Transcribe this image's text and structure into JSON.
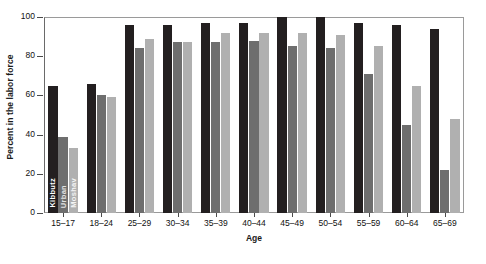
{
  "chart_data": {
    "type": "bar",
    "title": "",
    "xlabel": "Age",
    "ylabel": "Percent in the labor force",
    "categories": [
      "15–17",
      "18–24",
      "25–29",
      "30–34",
      "35–39",
      "40–44",
      "45–49",
      "50–54",
      "55–59",
      "60–64",
      "65–69"
    ],
    "series": [
      {
        "name": "Kibbutz",
        "color": "#231f20",
        "values": [
          65,
          66,
          96,
          96,
          97,
          97,
          100,
          100,
          97,
          96,
          94
        ]
      },
      {
        "name": "Urban",
        "color": "#6e6e6e",
        "values": [
          39,
          60,
          84,
          87,
          87,
          88,
          85,
          84,
          71,
          45,
          22
        ]
      },
      {
        "name": "Moshav",
        "color": "#b0b0b0",
        "values": [
          33,
          59,
          89,
          87,
          92,
          92,
          92,
          91,
          85,
          65,
          48
        ]
      }
    ],
    "ylim": [
      0,
      100
    ],
    "yticks": [
      0,
      20,
      40,
      60,
      80,
      100
    ],
    "grid": false,
    "legend_position": "in-bars-first-group",
    "in_bar_labels": [
      "Kibbutz",
      "Urban",
      "Moshav"
    ]
  }
}
